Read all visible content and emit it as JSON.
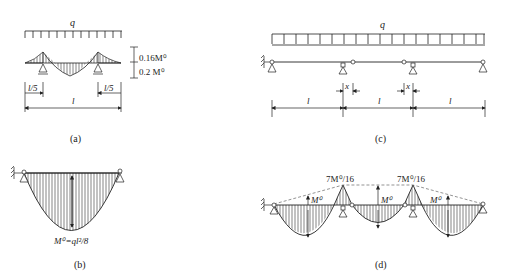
{
  "panels": {
    "a": {
      "caption": "(a)",
      "load_label": "q",
      "top_value": "0.16M⁰",
      "bottom_value": "0.2 M⁰",
      "left_dim": "l/5",
      "right_dim": "l/5",
      "span_dim": "l"
    },
    "b": {
      "caption": "(b)",
      "moment_label": "M⁰=ql²/8"
    },
    "c": {
      "caption": "(c)",
      "load_label": "q",
      "offset_left": "x",
      "offset_right": "x",
      "spans": [
        "l",
        "l",
        "l"
      ]
    },
    "d": {
      "caption": "(d)",
      "peak_left": "7M⁰/16",
      "peak_right": "7M⁰/16",
      "span_labels": [
        "M⁰",
        "M⁰",
        "M⁰"
      ]
    }
  }
}
